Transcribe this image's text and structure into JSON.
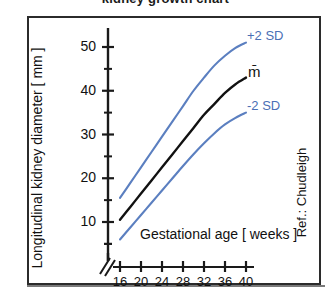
{
  "title_partial": "kidney growth chart",
  "frame": {
    "border_color": "#2b2b2b",
    "background": "#ffffff"
  },
  "colors": {
    "sd_curve": "#5b7fc0",
    "mean_curve": "#111111",
    "axis": "#1a1a1a",
    "text": "#111111"
  },
  "axes": {
    "y_title": "Longitudinal kidney diameter [ mm ]",
    "x_title": "Gestational age [ weeks ]",
    "y_ticks": [
      "10",
      "20",
      "30",
      "40",
      "50"
    ],
    "x_ticks": [
      "16",
      "20",
      "24",
      "28",
      "32",
      "36",
      "40"
    ],
    "axis_break": "broken-axis"
  },
  "curve_labels": {
    "upper": "+2 SD",
    "mean": "m̄",
    "lower": "-2 SD"
  },
  "reference": "Ref.: Chudleigh",
  "chart_data": {
    "type": "line",
    "title": "kidney growth chart",
    "xlabel": "Gestational age [ weeks ]",
    "ylabel": "Longitudinal kidney diameter [ mm ]",
    "xlim": [
      14,
      41
    ],
    "ylim": [
      0,
      55
    ],
    "xticks": [
      16,
      20,
      24,
      28,
      32,
      36,
      40
    ],
    "yticks": [
      10,
      20,
      30,
      40,
      50
    ],
    "minor_yticks": [
      5,
      15,
      25,
      35,
      45
    ],
    "grid": false,
    "legend": "inline-right-labels",
    "x": [
      16,
      18,
      20,
      22,
      24,
      26,
      28,
      30,
      32,
      34,
      36,
      38,
      40
    ],
    "series": [
      {
        "name": "+2 SD",
        "color": "#5b7fc0",
        "values": [
          15.5,
          19.0,
          22.5,
          26.0,
          29.5,
          33.0,
          36.5,
          40.0,
          43.0,
          45.8,
          48.0,
          49.8,
          51.0
        ]
      },
      {
        "name": "m̄",
        "color": "#111111",
        "values": [
          10.5,
          13.5,
          16.5,
          19.5,
          22.5,
          25.5,
          28.5,
          31.5,
          34.5,
          37.0,
          39.5,
          41.5,
          43.0
        ]
      },
      {
        "name": "-2 SD",
        "color": "#5b7fc0",
        "values": [
          6.0,
          8.8,
          11.6,
          14.4,
          17.2,
          20.0,
          22.8,
          25.5,
          28.0,
          30.3,
          32.3,
          33.8,
          35.0
        ]
      }
    ]
  }
}
